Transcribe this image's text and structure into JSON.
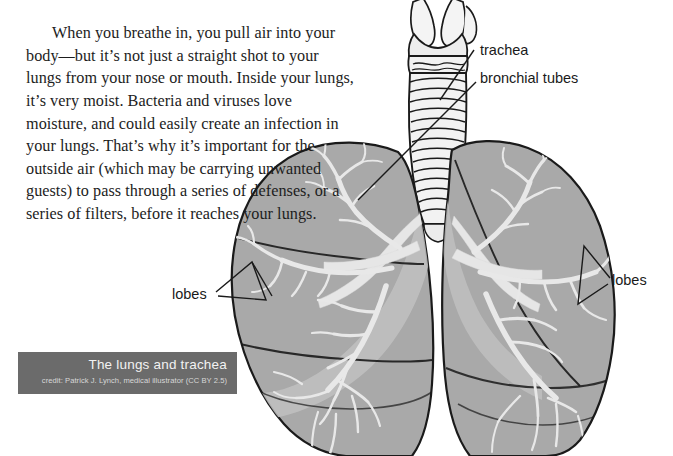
{
  "page": {
    "width": 673,
    "height": 456,
    "background": "#ffffff"
  },
  "body_text": {
    "paragraph": "When you breathe in, you pull air into your body—but it’s not just a straight shot to your lungs from your nose or mouth. Inside your lungs, it’s very moist. Bacteria and viruses love moisture, and could easily create an infection in your lungs. That’s why it’s important for the outside air (which may be carrying unwanted guests) to pass through a series of defenses, or a series of filters, before it reaches your lungs."
  },
  "figure": {
    "labels": {
      "trachea": "trachea",
      "bronchial_tubes": "bronchial tubes",
      "lobes_right": "lobes",
      "lobes_left": "lobes"
    },
    "caption": {
      "title": "The lungs and trachea",
      "credit": "credit: Patrick J. Lynch, medical illustrator (CC BY 2.5)"
    },
    "colors": {
      "lung_fill": "#a9a9a9",
      "lung_fill_light": "#c2c2c2",
      "bronchi_fill": "#e2e2e2",
      "trachea_fill": "#f0f0f0",
      "outline": "#1a1a1a",
      "caption_background": "#6b6b6b",
      "caption_title_color": "#f2f2f2",
      "caption_credit_color": "#d8d8d8",
      "leader_line": "#1a1a1a"
    }
  }
}
